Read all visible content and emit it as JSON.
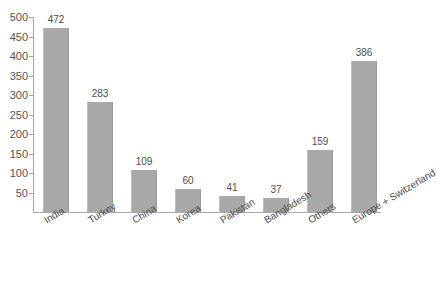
{
  "chart_data": {
    "type": "bar",
    "title": "",
    "subtitle": "",
    "xlabel": "",
    "ylabel": "",
    "categories": [
      "India",
      "Turkey",
      "China",
      "Korea",
      "Pakistan",
      "Bangladesh",
      "Others",
      "Europe + Switzerland"
    ],
    "values": [
      472,
      283,
      109,
      60,
      41,
      37,
      159,
      386
    ],
    "ylim": [
      0,
      500
    ],
    "ytick_labels": [
      "50",
      "100",
      "150",
      "200",
      "250",
      "300",
      "350",
      "400",
      "450",
      "500"
    ],
    "ytick_values": [
      50,
      100,
      150,
      200,
      250,
      300,
      350,
      400,
      450,
      500
    ],
    "grid": false,
    "legend": false,
    "legend_position": "none",
    "bar_color": "#a9a9a9",
    "axis_color": "#a6a6a6",
    "text_color": "#4d4d4d",
    "background": "#ffffff",
    "value_labels_shown": true,
    "xtick_label_rotation": -31
  },
  "title_remnant": "",
  "axis": {
    "y_axis_name": "y-axis",
    "x_axis_name": "x-axis"
  }
}
